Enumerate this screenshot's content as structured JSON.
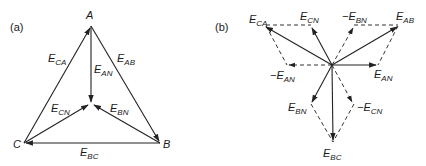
{
  "panels": [
    {
      "tag": "(a)",
      "nodes": {
        "A": {
          "label": "A",
          "x": 91,
          "y": 26
        },
        "B": {
          "label": "B",
          "x": 160,
          "y": 143
        },
        "C": {
          "label": "C",
          "x": 24,
          "y": 143
        },
        "N": {
          "label": "",
          "x": 91,
          "y": 104
        }
      },
      "vectors": [
        {
          "name": "E_CA",
          "main": "E",
          "sub": "CA",
          "from": "C",
          "to": "A",
          "style": "solid"
        },
        {
          "name": "E_AB",
          "main": "E",
          "sub": "AB",
          "from": "A",
          "to": "B",
          "style": "solid"
        },
        {
          "name": "E_BC",
          "main": "E",
          "sub": "BC",
          "from": "B",
          "to": "C",
          "style": "solid"
        },
        {
          "name": "E_AN",
          "main": "E",
          "sub": "AN",
          "from": "A",
          "to": "N",
          "style": "solid"
        },
        {
          "name": "E_BN",
          "main": "E",
          "sub": "BN",
          "from": "B",
          "to": "N",
          "style": "solid"
        },
        {
          "name": "E_CN",
          "main": "E",
          "sub": "CN",
          "from": "C",
          "to": "N",
          "style": "solid"
        }
      ]
    },
    {
      "tag": "(b)",
      "origin": {
        "x": 332,
        "y": 65
      },
      "vectors": [
        {
          "name": "E_CA",
          "main": "E",
          "sub": "CA",
          "prefix": "",
          "tip": [
            265,
            26
          ],
          "style": "solid"
        },
        {
          "name": "E_CN",
          "main": "E",
          "sub": "CN",
          "prefix": "",
          "tip": [
            311,
            27
          ],
          "style": "solid"
        },
        {
          "name": "-E_BN",
          "main": "E",
          "sub": "BN",
          "prefix": "−",
          "tip": [
            354,
            27
          ],
          "style": "dashed"
        },
        {
          "name": "E_AB",
          "main": "E",
          "sub": "AB",
          "prefix": "",
          "tip": [
            398,
            26
          ],
          "style": "solid"
        },
        {
          "name": "-E_AN",
          "main": "E",
          "sub": "AN",
          "prefix": "−",
          "tip": [
            287,
            65
          ],
          "style": "dashed"
        },
        {
          "name": "E_AN",
          "main": "E",
          "sub": "AN",
          "prefix": "",
          "tip": [
            378,
            65
          ],
          "style": "solid"
        },
        {
          "name": "E_BN",
          "main": "E",
          "sub": "BN",
          "prefix": "",
          "tip": [
            311,
            104
          ],
          "style": "solid"
        },
        {
          "name": "-E_CN",
          "main": "E",
          "sub": "CN",
          "prefix": "−",
          "tip": [
            353,
            104
          ],
          "style": "dashed"
        },
        {
          "name": "E_BC",
          "main": "E",
          "sub": "BC",
          "prefix": "",
          "tip": [
            333,
            142
          ],
          "style": "solid"
        }
      ],
      "construction_lines": [
        {
          "between": [
            "E_CA",
            "E_CN"
          ]
        },
        {
          "between": [
            "E_CA",
            "-E_AN"
          ]
        },
        {
          "between": [
            "-E_BN",
            "E_AB"
          ]
        },
        {
          "between": [
            "E_AB",
            "E_AN"
          ]
        },
        {
          "between": [
            "E_BN",
            "E_BC"
          ]
        },
        {
          "between": [
            "-E_CN",
            "E_BC"
          ]
        }
      ]
    }
  ]
}
